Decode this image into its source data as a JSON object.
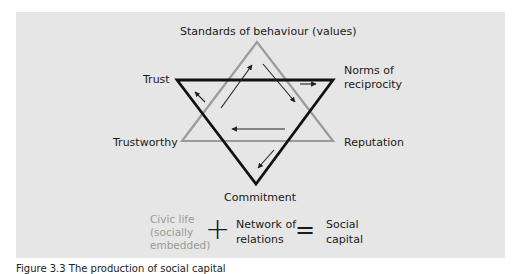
{
  "diagram": {
    "labels": {
      "top": "Standards of behaviour (values)",
      "trust": "Trust",
      "norms_line1": "Norms of",
      "norms_line2": "reciprocity",
      "trustworthy": "Trustworthy",
      "reputation": "Reputation",
      "commitment": "Commitment"
    },
    "colors": {
      "panel_bg": "#e6e6e6",
      "black_triangle": "#111111",
      "grey_triangle": "#9b9b9b",
      "arrows": "#222222",
      "civic_text": "#9a9a9a"
    },
    "triangles": {
      "grey_upward": {
        "apex": [
          257,
          42
        ],
        "bottom_left": [
          182,
          141
        ],
        "bottom_right": [
          333,
          141
        ]
      },
      "black_downward": {
        "top_left": [
          177,
          80
        ],
        "top_right": [
          333,
          80
        ],
        "apex": [
          256,
          184
        ]
      }
    },
    "arrows": [
      {
        "from": [
          205,
          102
        ],
        "to": [
          195,
          92
        ]
      },
      {
        "from": [
          221,
          108
        ],
        "to": [
          252,
          65
        ]
      },
      {
        "from": [
          263,
          64
        ],
        "to": [
          295,
          102
        ]
      },
      {
        "from": [
          300,
          84
        ],
        "to": [
          316,
          84
        ]
      },
      {
        "from": [
          285,
          129
        ],
        "to": [
          232,
          129
        ]
      },
      {
        "from": [
          274,
          150
        ],
        "to": [
          258,
          168
        ]
      }
    ]
  },
  "formula": {
    "term1_line1": "Civic life",
    "term1_line2": "(socially",
    "term1_line3": "embedded)",
    "plus": "+",
    "term2_line1": "Network of",
    "term2_line2": "relations",
    "equals": "=",
    "result_line1": "Social",
    "result_line2": "capital"
  },
  "caption": "Figure 3.3 The production of social capital"
}
